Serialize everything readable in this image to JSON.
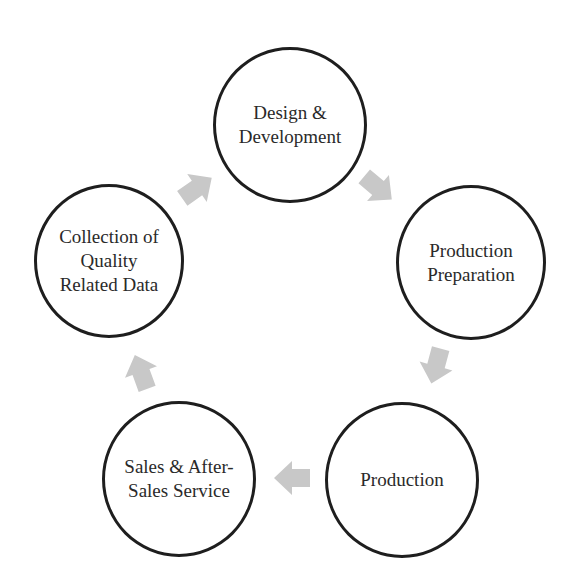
{
  "diagram": {
    "type": "cycle",
    "colors": {
      "circle_stroke": "#1e1e1e",
      "text": "#2a2a2a",
      "arrow_fill": "#c8c8c8",
      "background": "#ffffff"
    },
    "nodes": [
      {
        "id": "design",
        "label": "Design &\nDevelopment"
      },
      {
        "id": "prep",
        "label": "Production\nPreparation"
      },
      {
        "id": "production",
        "label": "Production"
      },
      {
        "id": "sales",
        "label": "Sales & After-\nSales Service"
      },
      {
        "id": "collection",
        "label": "Collection of\nQuality\nRelated Data"
      }
    ],
    "edges": [
      {
        "from": "design",
        "to": "prep",
        "icon": "arrow-down-right-icon"
      },
      {
        "from": "prep",
        "to": "production",
        "icon": "arrow-down-left-icon"
      },
      {
        "from": "production",
        "to": "sales",
        "icon": "arrow-left-icon"
      },
      {
        "from": "sales",
        "to": "collection",
        "icon": "arrow-up-left-icon"
      },
      {
        "from": "collection",
        "to": "design",
        "icon": "arrow-up-right-icon"
      }
    ]
  }
}
